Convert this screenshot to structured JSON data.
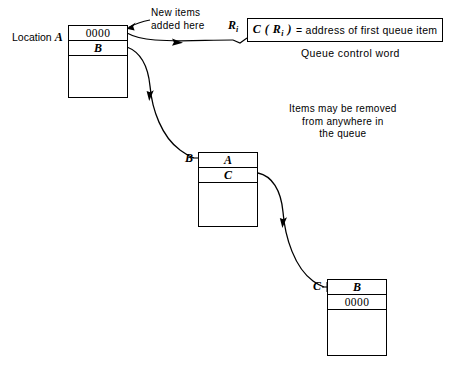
{
  "figure": {
    "background": "#ffffff",
    "line_color": "#000000"
  },
  "blocks": [
    {
      "label": "Location A",
      "label_kind": "prefixed",
      "cells": [
        "0000",
        "B"
      ]
    },
    {
      "label": "B",
      "label_kind": "plain",
      "cells": [
        "A",
        "C"
      ]
    },
    {
      "label": "C",
      "label_kind": "plain",
      "cells": [
        "B",
        "0000"
      ]
    }
  ],
  "block_a": {
    "label_prefix": "Location",
    "label_name": "A",
    "cell_1": "0000",
    "cell_2": "B"
  },
  "block_b": {
    "label_name": "B",
    "cell_1": "A",
    "cell_2": "C"
  },
  "block_c": {
    "label_name": "C",
    "cell_1": "B",
    "cell_2": "0000"
  },
  "annotations": {
    "new_items_line1": "New items",
    "new_items_line2": "added here",
    "removal_line1": "Items may be removed",
    "removal_line2": "from anywhere in",
    "removal_line3": "the queue"
  },
  "control_word": {
    "register": "R",
    "register_subscript": "i",
    "expression_prefix": "C ( R",
    "expression_sub": "i",
    "expression_suffix": " )",
    "expression_body": "= address of first queue item",
    "caption": "Queue control word"
  }
}
